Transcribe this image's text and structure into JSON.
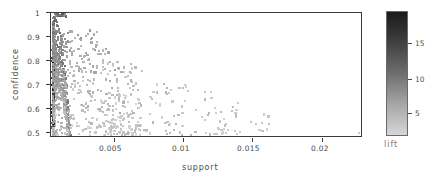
{
  "chart_data": {
    "type": "scatter",
    "title": "",
    "xlabel": "support",
    "ylabel": "confidence",
    "xlim": [
      0.0008,
      0.0228
    ],
    "ylim": [
      0.49,
      1.01
    ],
    "grid": false,
    "xticks": [
      "0.005",
      "0.01",
      "0.015",
      "0.02"
    ],
    "xtick_values": [
      0.005,
      0.01,
      0.015,
      0.02
    ],
    "yticks": [
      "1",
      "0.9",
      "0.8",
      "0.7",
      "0.6",
      "0.5"
    ],
    "ytick_values": [
      1,
      0.9,
      0.8,
      0.7,
      0.6,
      0.5
    ],
    "colorbar": {
      "label": "lift",
      "ticks": [
        "15",
        "10",
        "5"
      ],
      "tick_values": [
        15,
        10,
        5
      ],
      "range": [
        1,
        18.5
      ],
      "high_color": "#1a1a1a",
      "low_color": "#d6d6d6",
      "orientation": "vertical",
      "position": "right"
    },
    "marker": "square",
    "marker_size": 2.2,
    "series_name": "rules",
    "color_variable": "lift",
    "n_points": 1160
  }
}
